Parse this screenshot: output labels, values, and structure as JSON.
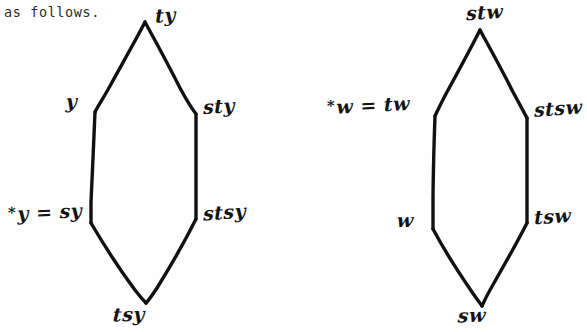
{
  "page": {
    "width": 587,
    "height": 332,
    "background": "#fefefe",
    "ink_color": "#141414"
  },
  "body_text": {
    "line_1": "as follows."
  },
  "figure": {
    "kind": "hand-drawn-hasse-diagram-pair",
    "diagrams": [
      {
        "id": "left-lattice",
        "generator": "y",
        "labels": {
          "top": "ty",
          "upper_left": "y",
          "upper_right": "sty",
          "lower_left": "*y = sy",
          "lower_right": "stsy",
          "bottom": "tsy"
        },
        "vertices": {
          "top": [
            145,
            22
          ],
          "upper_left": [
            95,
            112
          ],
          "upper_right": [
            196,
            114
          ],
          "lower_left": [
            91,
            223
          ],
          "lower_right": [
            196,
            219
          ],
          "bottom": [
            146,
            303
          ]
        }
      },
      {
        "id": "right-lattice",
        "generator": "w",
        "labels": {
          "top": "stw",
          "upper_left": "*w = tw",
          "upper_right": "stsw",
          "lower_left": "w",
          "lower_right": "tsw",
          "bottom": "sw"
        },
        "vertices": {
          "top": [
            480,
            30
          ],
          "upper_left": [
            435,
            116
          ],
          "upper_right": [
            527,
            118
          ],
          "lower_left": [
            433,
            229
          ],
          "lower_right": [
            527,
            223
          ],
          "bottom": [
            482,
            306
          ]
        }
      }
    ]
  }
}
